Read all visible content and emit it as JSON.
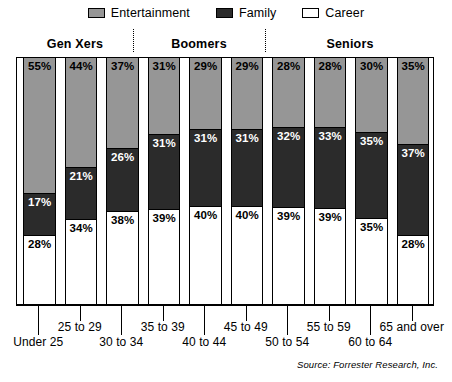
{
  "legend": {
    "items": [
      {
        "label": "Entertainment",
        "swatch": "ent",
        "color": "#969696",
        "icon": "legend-swatch-icon"
      },
      {
        "label": "Family",
        "swatch": "fam",
        "color": "#2b2b2b",
        "icon": "legend-swatch-icon"
      },
      {
        "label": "Career",
        "swatch": "car",
        "color": "#ffffff",
        "icon": "legend-swatch-icon"
      }
    ]
  },
  "groups": [
    {
      "label": "Gen Xers",
      "center_x": 75,
      "bars": [
        0,
        1,
        2
      ]
    },
    {
      "label": "Boomers",
      "center_x": 199,
      "bars": [
        3,
        4,
        5
      ]
    },
    {
      "label": "Seniors",
      "center_x": 350,
      "bars": [
        6,
        7,
        8,
        9
      ]
    }
  ],
  "dividers": [
    133,
    265
  ],
  "source": "Source: Forrester Research, Inc.",
  "chart_data": {
    "type": "bar",
    "title": "",
    "subtitle": "",
    "stacked": true,
    "stack_order_top_to_bottom": [
      "Entertainment",
      "Family",
      "Career"
    ],
    "xlabel": "",
    "ylabel": "",
    "ylim": [
      0,
      100
    ],
    "grid": false,
    "legend_position": "top-center",
    "categories": [
      "Under 25",
      "25 to 29",
      "30 to 34",
      "35 to 39",
      "40 to 44",
      "45 to 49",
      "50 to 54",
      "55 to 59",
      "60 to 64",
      "65 and over"
    ],
    "series": [
      {
        "name": "Entertainment",
        "color": "#969696",
        "values": [
          55,
          44,
          37,
          31,
          29,
          29,
          28,
          28,
          30,
          35
        ]
      },
      {
        "name": "Family",
        "color": "#2b2b2b",
        "values": [
          17,
          21,
          26,
          31,
          31,
          31,
          32,
          33,
          35,
          37
        ]
      },
      {
        "name": "Career",
        "color": "#ffffff",
        "values": [
          28,
          34,
          38,
          39,
          40,
          40,
          39,
          39,
          35,
          28
        ]
      }
    ],
    "value_suffix": "%",
    "bars": [
      {
        "category": "Under 25",
        "label_side": "lo",
        "ent": "55%",
        "fam": "17%",
        "car": "28%"
      },
      {
        "category": "25 to 29",
        "label_side": "hi",
        "ent": "44%",
        "fam": "21%",
        "car": "34%"
      },
      {
        "category": "30 to 34",
        "label_side": "lo",
        "ent": "37%",
        "fam": "26%",
        "car": "38%"
      },
      {
        "category": "35 to 39",
        "label_side": "hi",
        "ent": "31%",
        "fam": "31%",
        "car": "39%"
      },
      {
        "category": "40 to 44",
        "label_side": "lo",
        "ent": "29%",
        "fam": "31%",
        "car": "40%"
      },
      {
        "category": "45 to 49",
        "label_side": "hi",
        "ent": "29%",
        "fam": "31%",
        "car": "40%"
      },
      {
        "category": "50 to 54",
        "label_side": "lo",
        "ent": "28%",
        "fam": "32%",
        "car": "39%"
      },
      {
        "category": "55 to 59",
        "label_side": "hi",
        "ent": "28%",
        "fam": "33%",
        "car": "39%"
      },
      {
        "category": "60 to 64",
        "label_side": "lo",
        "ent": "30%",
        "fam": "35%",
        "car": "35%"
      },
      {
        "category": "65 and over",
        "label_side": "hi",
        "ent": "35%",
        "fam": "37%",
        "car": "28%"
      }
    ]
  }
}
